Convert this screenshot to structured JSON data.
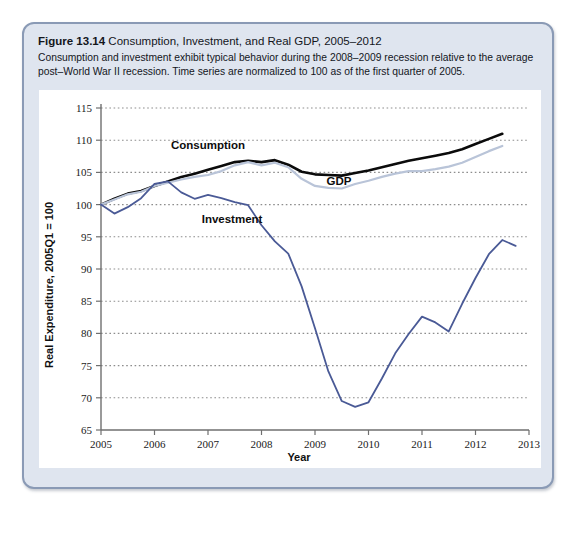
{
  "figure": {
    "label": "Figure 13.14",
    "title": "Consumption, Investment, and Real GDP, 2005–2012",
    "caption": "Consumption and investment exhibit typical behavior during the 2008–2009 recession relative to the average post–World War II recession. Time series are normalized to 100 as of the first quarter of 2005."
  },
  "colors": {
    "card_background": "#dfe5ef",
    "card_border": "#8a9ab5",
    "panel_background": "#ffffff",
    "gridline": "#8d8d8d",
    "axis": "#6f6f6f",
    "consumption": "#0b0b0b",
    "gdp": "#b9c4d8",
    "investment": "#4a5a96"
  },
  "chart_data": {
    "type": "line",
    "title": "Consumption, Investment, and Real GDP, 2005–2012",
    "xlabel": "Year",
    "ylabel": "Real Expenditure, 2005Q1 = 100",
    "xlim": [
      2005,
      2013
    ],
    "ylim": [
      65,
      115
    ],
    "xticks": [
      "2005",
      "2006",
      "2007",
      "2008",
      "2009",
      "2010",
      "2011",
      "2012",
      "2013"
    ],
    "yticks": [
      "65",
      "70",
      "75",
      "80",
      "85",
      "90",
      "95",
      "100",
      "105",
      "110",
      "115"
    ],
    "grid": "horizontal dotted",
    "legend_position": "inline annotations on curves",
    "x": [
      2005.0,
      2005.25,
      2005.5,
      2005.75,
      2006.0,
      2006.25,
      2006.5,
      2006.75,
      2007.0,
      2007.25,
      2007.5,
      2007.75,
      2008.0,
      2008.25,
      2008.5,
      2008.75,
      2009.0,
      2009.25,
      2009.5,
      2009.75,
      2010.0,
      2010.25,
      2010.5,
      2010.75,
      2011.0,
      2011.25,
      2011.5,
      2011.75,
      2012.0,
      2012.25,
      2012.5
    ],
    "series": [
      {
        "name": "Consumption",
        "color": "#0b0b0b",
        "label_x": 2007.0,
        "label_y": 108.6,
        "values": [
          100.0,
          100.9,
          101.7,
          102.1,
          102.9,
          103.6,
          104.3,
          104.8,
          105.4,
          106.0,
          106.6,
          106.8,
          106.6,
          106.9,
          106.2,
          105.1,
          104.7,
          104.6,
          104.5,
          104.9,
          105.3,
          105.8,
          106.3,
          106.8,
          107.2,
          107.6,
          108.0,
          108.6,
          109.4,
          110.2,
          111.0
        ]
      },
      {
        "name": "GDP",
        "color": "#b9c4d8",
        "label_x": 2009.45,
        "label_y": 103.0,
        "values": [
          100.0,
          100.8,
          101.6,
          102.0,
          102.9,
          103.4,
          103.9,
          104.3,
          104.6,
          105.2,
          106.1,
          106.6,
          106.1,
          106.5,
          105.8,
          104.0,
          102.9,
          102.6,
          102.5,
          103.2,
          103.7,
          104.3,
          104.8,
          105.2,
          105.2,
          105.5,
          105.9,
          106.5,
          107.4,
          108.3,
          109.1
        ]
      },
      {
        "name": "Investment",
        "color": "#4a5a96",
        "label_x": 2007.45,
        "label_y": 97.1,
        "values": [
          100.0,
          98.6,
          99.6,
          101.0,
          103.2,
          103.6,
          101.9,
          100.9,
          101.5,
          101.0,
          100.4,
          99.9,
          96.8,
          94.3,
          92.4,
          87.3,
          80.8,
          74.1,
          69.5,
          68.6,
          69.3,
          73.0,
          76.9,
          79.9,
          82.6,
          81.7,
          80.3,
          84.6,
          88.6,
          92.3,
          94.5
        ]
      }
    ],
    "series_extra_points": {
      "Investment": [
        {
          "x": 2012.75,
          "y": 93.6
        }
      ]
    }
  }
}
